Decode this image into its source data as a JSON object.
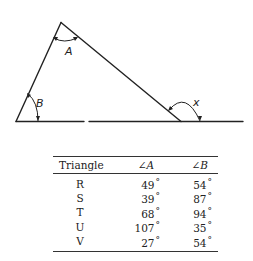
{
  "diagram": {
    "labels": {
      "angle_a": "A",
      "angle_b": "B",
      "angle_x": "x"
    }
  },
  "table": {
    "headers": [
      "Triangle",
      "∠A",
      "∠B"
    ],
    "degree_symbol": "°",
    "rows": [
      {
        "triangle": "R",
        "angle_a": "49",
        "angle_b": "54"
      },
      {
        "triangle": "S",
        "angle_a": "39",
        "angle_b": "87"
      },
      {
        "triangle": "T",
        "angle_a": "68",
        "angle_b": "94"
      },
      {
        "triangle": "U",
        "angle_a": "107",
        "angle_b": "35"
      },
      {
        "triangle": "V",
        "angle_a": "27",
        "angle_b": "54"
      }
    ]
  }
}
